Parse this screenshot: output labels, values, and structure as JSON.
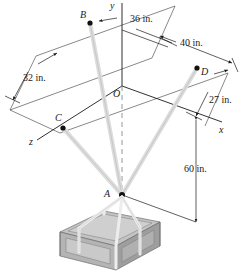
{
  "figure": {
    "type": "engineering-statics-diagram",
    "background": "#ffffff",
    "ink_color": "#1a1a1a",
    "cable_color": "#d9d9d9",
    "cable_edge_color": "#b3b3b3"
  },
  "axes": {
    "origin_label": "O",
    "x_label": "x",
    "y_label": "y",
    "z_label": "z"
  },
  "points": [
    {
      "id": "B",
      "label": "B"
    },
    {
      "id": "C",
      "label": "C"
    },
    {
      "id": "D",
      "label": "D"
    },
    {
      "id": "A",
      "label": "A"
    },
    {
      "id": "O",
      "label": "O"
    }
  ],
  "dimensions": [
    {
      "id": "d36",
      "label": "36 in.",
      "value": 36,
      "unit": "in."
    },
    {
      "id": "d40",
      "label": "40 in.",
      "value": 40,
      "unit": "in."
    },
    {
      "id": "d32",
      "label": "32 in.",
      "value": 32,
      "unit": "in."
    },
    {
      "id": "d27",
      "label": "27 in.",
      "value": 27,
      "unit": "in."
    },
    {
      "id": "d60",
      "label": "60 in.",
      "value": 60,
      "unit": "in."
    }
  ],
  "crate": {
    "top_color": "#c4c4c4",
    "left_color": "#d6d6d6",
    "front_color": "#a9a9a9",
    "strap_color": "#ececec"
  }
}
